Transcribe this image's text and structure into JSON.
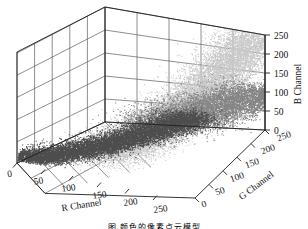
{
  "figure": {
    "kind": "3d-scatter",
    "background": "#ffffff",
    "caption": "图            颜色的像素点云模型"
  },
  "chart_data": {
    "type": "scatter",
    "title": "",
    "projection": "3d",
    "xlabel": "R Channel",
    "ylabel": "G Channel",
    "zlabel": "B Channel",
    "xlim": [
      0,
      255
    ],
    "ylim": [
      0,
      255
    ],
    "zlim": [
      0,
      255
    ],
    "xticks": [
      0,
      50,
      100,
      150,
      200,
      250
    ],
    "yticks": [
      0,
      50,
      100,
      150,
      200,
      250
    ],
    "zticks": [
      0,
      50,
      100,
      150,
      200,
      250
    ],
    "xticklabels": [
      "0",
      "50",
      "100",
      "150",
      "200",
      "250"
    ],
    "yticklabels": [
      "0",
      "50",
      "100",
      "150",
      "200",
      "250"
    ],
    "zticklabels": [
      "0",
      "50",
      "100",
      "150",
      "200",
      "250"
    ],
    "grid": true,
    "legend": false,
    "panes": [
      "left-wall",
      "back-wall",
      "floor"
    ],
    "series": [
      {
        "name": "dark-cluster",
        "color": "#4d4d4d",
        "point_size": 1,
        "approx_count": 9000,
        "centroid": [
          70,
          55,
          35
        ],
        "spread": [
          60,
          50,
          35
        ],
        "description": "dark low-RGB pixel cloud at low R/low G, hugging the floor"
      },
      {
        "name": "light-cluster",
        "color": "#c9c9c9",
        "point_size": 1,
        "approx_count": 14000,
        "centroid": [
          170,
          150,
          120
        ],
        "spread": [
          70,
          70,
          80
        ],
        "description": "bright high-RGB pixel cloud forming the large central lobe rising toward B=250"
      },
      {
        "name": "mid-cluster",
        "color": "#858585",
        "point_size": 1,
        "approx_count": 6000,
        "centroid": [
          215,
          215,
          60
        ],
        "spread": [
          45,
          45,
          50
        ],
        "description": "mid-gray pixel cloud along the right front edge at high G"
      }
    ]
  },
  "axes": {
    "x": {
      "label": "R Channel",
      "ticks": [
        "0",
        "50",
        "100",
        "150",
        "200",
        "250"
      ]
    },
    "y": {
      "label": "G Channel",
      "ticks": [
        "0",
        "50",
        "100",
        "150",
        "200",
        "250"
      ]
    },
    "z": {
      "label": "B Channel",
      "ticks": [
        "0",
        "50",
        "100",
        "150",
        "200",
        "250"
      ]
    }
  },
  "colors": {
    "axis_line": "#2b2b2b",
    "grid_line": "#5a5a5a",
    "dark_points": "#4d4d4d",
    "light_points": "#c9c9c9",
    "mid_points": "#858585",
    "text": "#111111"
  }
}
